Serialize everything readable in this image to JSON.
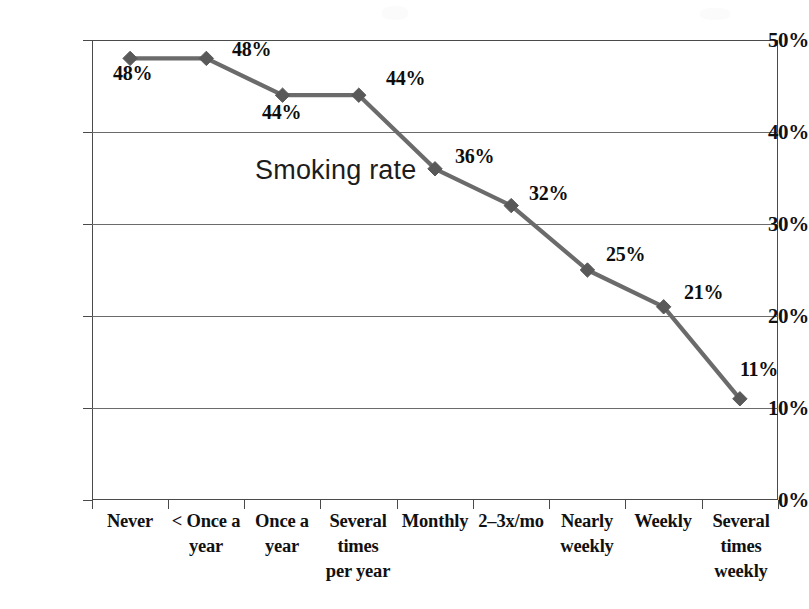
{
  "chart_data": {
    "type": "line",
    "title": "",
    "annotation": "Smoking rate",
    "xlabel": "",
    "ylabel": "",
    "ylim": [
      0,
      50
    ],
    "ytick_labels": [
      "50%",
      "40%",
      "30%",
      "20%",
      "10%",
      "0%"
    ],
    "ytick_values": [
      50,
      40,
      30,
      20,
      10,
      0
    ],
    "grid": true,
    "legend": "none",
    "categories": [
      "Never",
      "< Once a\nyear",
      "Once a\nyear",
      "Several\ntimes\nper year",
      "Monthly",
      "2–3x/mo",
      "Nearly\nweekly",
      "Weekly",
      "Several\ntimes\nweekly"
    ],
    "values": [
      48,
      48,
      44,
      44,
      36,
      32,
      25,
      21,
      11
    ],
    "point_labels": [
      "48%",
      "48%",
      "44%",
      "44%",
      "36%",
      "32%",
      "25%",
      "21%",
      "11%"
    ],
    "series": [
      {
        "name": "Smoking rate",
        "values": [
          48,
          48,
          44,
          44,
          36,
          32,
          25,
          21,
          11
        ]
      }
    ],
    "colors": {
      "line": "#6b6b6b",
      "marker": "#595959",
      "axis": "#4a4a4a",
      "grid": "#6b6b6b",
      "text": "#111111"
    },
    "marker": "diamond"
  }
}
